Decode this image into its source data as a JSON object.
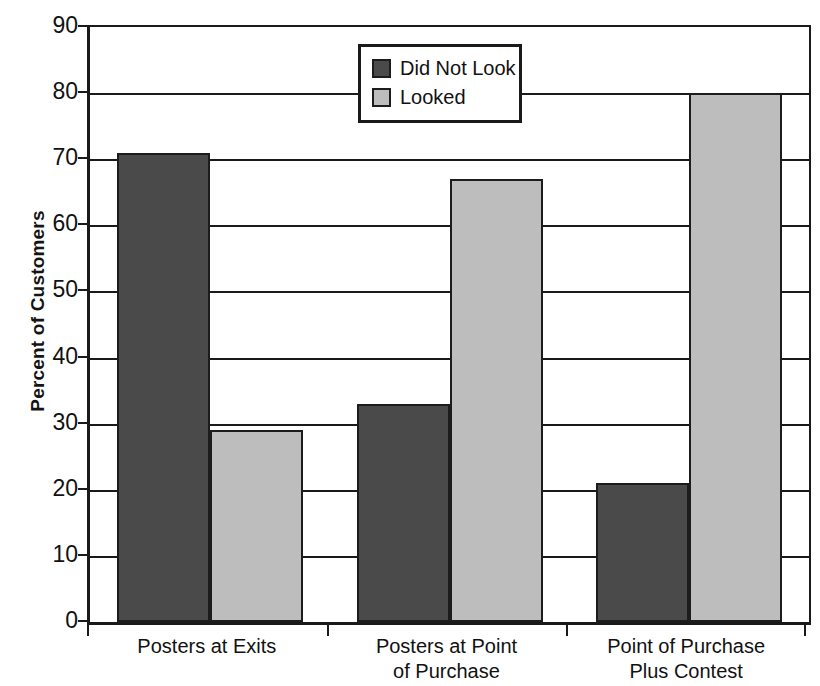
{
  "chart_data": {
    "type": "bar",
    "title": "",
    "subtitle": "",
    "xlabel": "",
    "ylabel": "Percent of Customers",
    "ylim": [
      0,
      90
    ],
    "yticks": [
      0,
      10,
      20,
      30,
      40,
      50,
      60,
      70,
      80,
      90
    ],
    "ytick_labels": [
      "0",
      "10",
      "20",
      "30",
      "40",
      "50",
      "60",
      "70",
      "80",
      "90"
    ],
    "grid": true,
    "legend_position": "top-center",
    "categories": [
      "Posters at Exits",
      "Posters at Point of Purchase",
      "Point of Purchase Plus Contest"
    ],
    "category_lines": [
      [
        "Posters at Exits"
      ],
      [
        "Posters at Point",
        "of Purchase"
      ],
      [
        "Point of Purchase",
        "Plus Contest"
      ]
    ],
    "series": [
      {
        "name": "Did Not Look",
        "color": "#4a4a4a",
        "values": [
          71,
          33,
          21
        ]
      },
      {
        "name": "Looked",
        "color": "#bdbdbd",
        "values": [
          29,
          67,
          80
        ]
      }
    ],
    "annotations": []
  },
  "legend": {
    "entries": [
      {
        "label": "Did Not Look",
        "color": "#4a4a4a"
      },
      {
        "label": "Looked",
        "color": "#bdbdbd"
      }
    ]
  },
  "axis": {
    "y_title": "Percent of Customers",
    "axis_color": "#1a1a1a"
  }
}
